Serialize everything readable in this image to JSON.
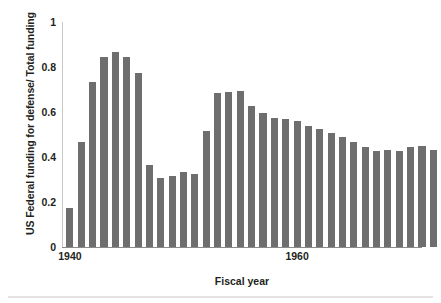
{
  "chart_data": {
    "type": "bar",
    "title": "",
    "subtitle": "",
    "xlabel": "Fiscal year",
    "ylabel": "US Federal funding for defense/ Total funding",
    "xlim": [
      1939.3,
      1971.0
    ],
    "ylim": [
      0,
      1
    ],
    "xticks": [
      1940,
      1960,
      1980,
      2000
    ],
    "xtick_labels": [
      "1940",
      "1960",
      "1980",
      "2000"
    ],
    "yticks": [
      0,
      0.2,
      0.4,
      0.6,
      0.8,
      1
    ],
    "ytick_labels": [
      "0",
      "0.2",
      "0.4",
      "0.6",
      "0.8",
      "1"
    ],
    "grid": false,
    "legend": null,
    "bar_color": "#6e6e6e",
    "axis_color": "#8a8a8a",
    "text_color": "#231f20",
    "categories": [
      1940,
      1941,
      1942,
      1943,
      1944,
      1945,
      1946,
      1947,
      1948,
      1949,
      1950,
      1951,
      1952,
      1953,
      1954,
      1955,
      1956,
      1957,
      1958,
      1959,
      1960,
      1961,
      1962,
      1963,
      1964,
      1965,
      1966,
      1967,
      1968,
      1969,
      1970,
      1971,
      1972,
      1973,
      1974,
      1975,
      1976,
      1977,
      1978,
      1979,
      1980,
      1981,
      1982,
      1983,
      1984,
      1985,
      1986,
      1987,
      1988,
      1989,
      1990,
      1991,
      1992,
      1993,
      1994,
      1995,
      1996,
      1997,
      1998,
      1999,
      2000,
      2001,
      2002,
      2003,
      2004,
      2005,
      2006,
      2007,
      2008,
      2009,
      2010
    ],
    "values": [
      0.175,
      0.465,
      0.735,
      0.845,
      0.865,
      0.845,
      0.775,
      0.365,
      0.305,
      0.315,
      0.335,
      0.325,
      0.515,
      0.685,
      0.69,
      0.695,
      0.625,
      0.595,
      0.575,
      0.57,
      0.56,
      0.54,
      0.525,
      0.505,
      0.49,
      0.465,
      0.445,
      0.425,
      0.43,
      0.425,
      0.445,
      0.45,
      0.43,
      0.385,
      0.345,
      0.32,
      0.315,
      0.275,
      0.245,
      0.235,
      0.23,
      0.225,
      0.23,
      0.228,
      0.235,
      0.25,
      0.26,
      0.265,
      0.268,
      0.27,
      0.27,
      0.268,
      0.24,
      0.21,
      0.205,
      0.2,
      0.19,
      0.18,
      0.172,
      0.17,
      0.165,
      0.165,
      0.17,
      0.17,
      0.185,
      0.195,
      0.198,
      0.196,
      0.198,
      0.198,
      0.205
    ]
  }
}
